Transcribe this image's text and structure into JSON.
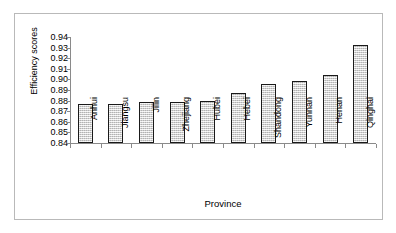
{
  "chart_data": {
    "type": "bar",
    "title": "",
    "xlabel": "Province",
    "ylabel": "Efficiency scores",
    "categories": [
      "Anhui",
      "Jiangsu",
      "Jilin",
      "Zhejiang",
      "Hubei",
      "Hebei",
      "Shandong",
      "Yunnan",
      "Henan",
      "Qinghai"
    ],
    "values": [
      0.8765,
      0.8765,
      0.879,
      0.879,
      0.8795,
      0.887,
      0.8955,
      0.8985,
      0.9045,
      0.9325
    ],
    "ylim": [
      0.84,
      0.94
    ],
    "ytick_labels": [
      "0.94",
      "0.93",
      "0.92",
      "0.91",
      "0.90",
      "0.89",
      "0.88",
      "0.87",
      "0.86",
      "0.85",
      "0.84"
    ],
    "ytick_values": [
      0.94,
      0.93,
      0.92,
      0.91,
      0.9,
      0.89,
      0.88,
      0.87,
      0.86,
      0.85,
      0.84
    ],
    "grid": false,
    "legend": "none",
    "bar_fill_color": "#d8d8d8",
    "bar_edge_color": "#1a1a1a",
    "axis_color": "#8a8a8a",
    "background_color": "#ffffff"
  }
}
